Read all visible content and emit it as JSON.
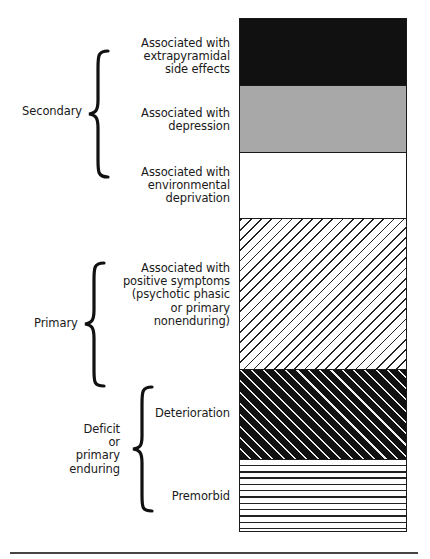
{
  "groups": [
    {
      "label": "Secondary",
      "label_lines": "Secondary"
    },
    {
      "label": "Primary",
      "label_lines": "Primary"
    },
    {
      "label": "Deficit or primary enduring",
      "label_lines": "Deficit\nor\nprimary\nenduring"
    }
  ],
  "segments": [
    {
      "label": "Associated with\nextrapyramidal\nside effects",
      "group": "Secondary",
      "fill": "solid-black",
      "color": "#111111"
    },
    {
      "label": "Associated with\ndepression",
      "group": "Secondary",
      "fill": "solid-gray",
      "color": "#a8a8a8"
    },
    {
      "label": "Associated with\nenvironmental\ndeprivation",
      "group": "Secondary",
      "fill": "white",
      "color": "#ffffff"
    },
    {
      "label": "Associated with\npositive symptoms\n(psychotic phasic\nor primary\nnonenduring)",
      "group": "Primary",
      "fill": "diagonal-hatch-light",
      "color": "#ffffff"
    },
    {
      "label": "Deterioration",
      "group": "Deficit or primary enduring",
      "fill": "diagonal-hatch-dark",
      "color": "#111111"
    },
    {
      "label": "Premorbid",
      "group": "Deficit or primary enduring",
      "fill": "horizontal-lines",
      "color": "#ffffff"
    }
  ]
}
